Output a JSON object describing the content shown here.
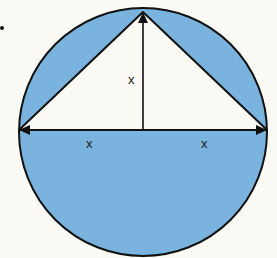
{
  "diagram": {
    "labels": {
      "height": "x",
      "left_half": "x",
      "right_half": "x"
    },
    "colors": {
      "fill": "#7ab3dd",
      "inner": "#fbfaf4",
      "stroke": "#111111"
    }
  }
}
